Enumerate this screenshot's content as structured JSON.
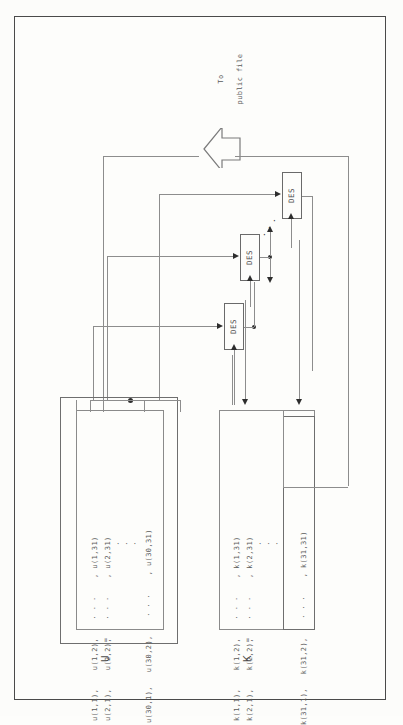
{
  "figure": {
    "orientation": "rotated-90",
    "background_color": "#fdfdfb",
    "line_color": "#8d8d8d",
    "ink_color": "#4a4a4a"
  },
  "output": {
    "label_line1": "To",
    "label_line2": "public file",
    "arrow_icon": "block-arrow-up-icon"
  },
  "processors": {
    "label": "DES",
    "count_visible": 3,
    "ellipsis": "·  ·  ·",
    "items": [
      {
        "label": "DES",
        "index": 1
      },
      {
        "label": "DES",
        "index": 2
      },
      {
        "label": "DES",
        "index": 3
      }
    ]
  },
  "matrix_u": {
    "name": "U",
    "equals": "=",
    "rows": [
      {
        "cells": [
          "u(1,1),",
          "u(1,2),",
          "· · ·",
          ", u(1,31)"
        ]
      },
      {
        "cells": [
          "u(2,1),",
          "u(2,2),",
          "· · ·",
          ", u(2,31)"
        ]
      },
      {
        "cells": [
          "u(30,1),",
          "u(30,2),",
          "· · ·",
          ", u(30,31)"
        ]
      }
    ],
    "row_ellipsis": "·\n·\n·",
    "dims": "30 x 31"
  },
  "matrix_k": {
    "name": "K",
    "equals": "=",
    "rows": [
      {
        "cells": [
          "k(1,1),",
          "k(1,2),",
          "· · ·",
          ", k(1,31)"
        ]
      },
      {
        "cells": [
          "k(2,1),",
          "k(2,2),",
          "· · ·",
          ", k(2,31)"
        ]
      },
      {
        "cells": [
          "k(31,1),",
          "k(31,2),",
          "· · ·",
          ", k(31,31)"
        ]
      }
    ],
    "row_ellipsis": "·\n·\n·",
    "dims": "31 x 31"
  }
}
